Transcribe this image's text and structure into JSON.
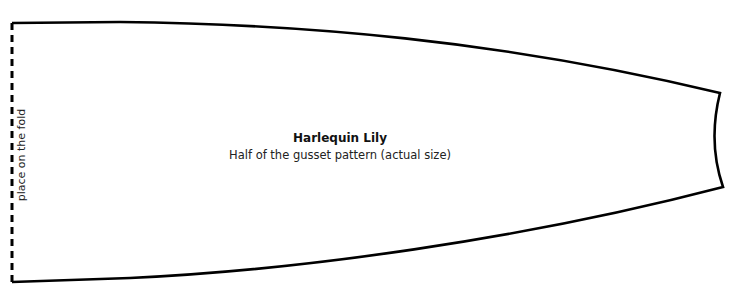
{
  "diagram": {
    "title": "Harlequin Lily",
    "subtitle": "Half of the gusset pattern (actual size)",
    "fold_label": "place on the fold",
    "colors": {
      "outline": "#000000",
      "background": "#ffffff",
      "text": "#222222"
    }
  }
}
